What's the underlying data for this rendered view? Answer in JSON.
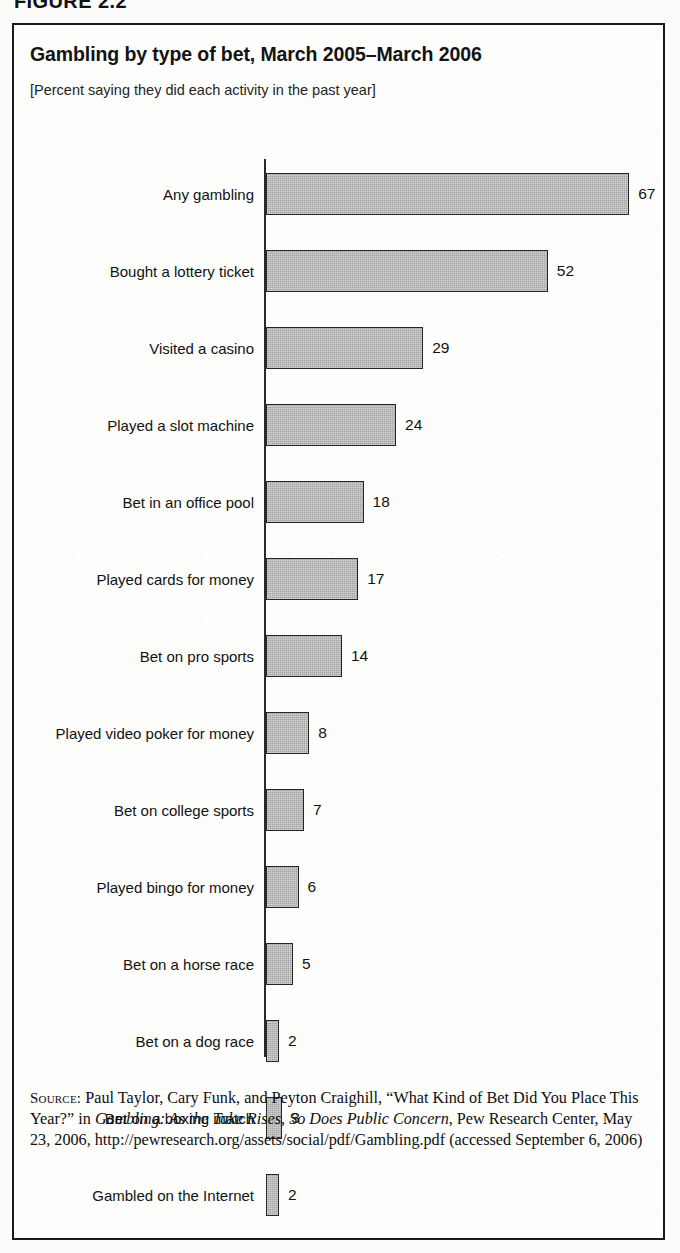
{
  "figure": {
    "number_label": "FIGURE 2.2"
  },
  "chart_data": {
    "type": "bar",
    "orientation": "horizontal",
    "title": "Gambling by type of bet, March 2005–March 2006",
    "subtitle": "[Percent saying they did each activity in the past year]",
    "xlabel": "",
    "ylabel": "",
    "xlim": [
      0,
      70
    ],
    "grid": false,
    "legend": null,
    "value_suffix": "",
    "bar_color": "#a3a3a3",
    "bar_border_color": "#262626",
    "axis_color": "#2a2a2a",
    "categories": [
      "Any gambling",
      "Bought a lottery ticket",
      "Visited a casino",
      "Played a slot machine",
      "Bet in an office pool",
      "Played cards for money",
      "Bet on pro sports",
      "Played video poker for money",
      "Bet on college sports",
      "Played bingo for money",
      "Bet on a horse race",
      "Bet on a dog race",
      "Bet on a boxing match",
      "Gambled on the Internet"
    ],
    "values": [
      67,
      52,
      29,
      24,
      18,
      17,
      14,
      8,
      7,
      6,
      5,
      2,
      3,
      2
    ],
    "value_labels": [
      "67",
      "52",
      "29",
      "24",
      "18",
      "17",
      "14",
      "8",
      "7",
      "6",
      "5",
      "2",
      "3",
      "2"
    ]
  },
  "source": {
    "label": "Source:",
    "text_part1": " Paul Taylor, Cary Funk, and Peyton Craighill, “What Kind of Bet Did You Place This Year?” in ",
    "italic_title": "Gambling: As the Take Rises, So Does Public Concern",
    "text_part2": ", Pew Research Center, May 23, 2006, http://pewresearch.org/assets/social/pdf/Gambling.pdf (accessed September 6, 2006)"
  }
}
